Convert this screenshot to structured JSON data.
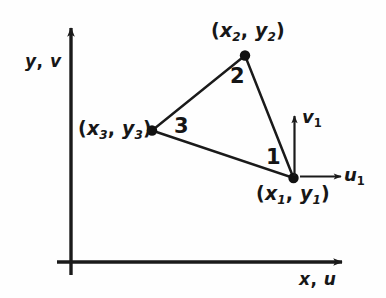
{
  "figure": {
    "background_color": "#fefefe",
    "ink_color": "#1a1a1a",
    "axes": {
      "vertical": {
        "name": "y-v-axis",
        "label": "y, v",
        "label_parts": {
          "first": "y",
          "comma": ",",
          "second": "v"
        }
      },
      "horizontal": {
        "name": "x-u-axis",
        "label": "x, u",
        "label_parts": {
          "first": "x",
          "comma": ",",
          "second": "u"
        }
      }
    },
    "nodes": [
      {
        "id": "node-1",
        "label": "(x1, y1)",
        "x_symbol": "x",
        "x_sub": "1",
        "y_symbol": "y",
        "y_sub": "1",
        "open_paren": "(",
        "comma": ",",
        "close_paren": ")"
      },
      {
        "id": "node-2",
        "label": "(x2, y2)",
        "x_symbol": "x",
        "x_sub": "2",
        "y_symbol": "y",
        "y_sub": "2",
        "open_paren": "(",
        "comma": ",",
        "close_paren": ")"
      },
      {
        "id": "node-3",
        "label": "(x3, y3)",
        "x_symbol": "x",
        "x_sub": "3",
        "y_symbol": "y",
        "y_sub": "3",
        "open_paren": "(",
        "comma": ",",
        "close_paren": ")"
      }
    ],
    "edges": [
      {
        "id": "edge-1",
        "label": "1"
      },
      {
        "id": "edge-2",
        "label": "2"
      },
      {
        "id": "edge-3",
        "label": "3"
      }
    ],
    "local_vectors": [
      {
        "id": "u1-vector",
        "symbol": "u",
        "subscript": "1",
        "direction": "right"
      },
      {
        "id": "v1-vector",
        "symbol": "v",
        "subscript": "1",
        "direction": "up"
      }
    ]
  }
}
